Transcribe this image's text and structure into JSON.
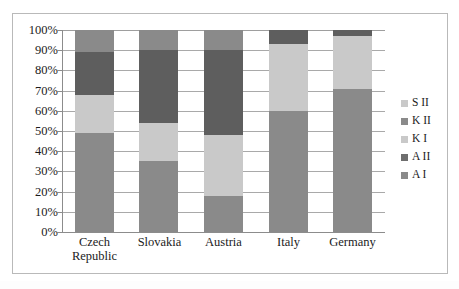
{
  "chart_data": {
    "type": "bar",
    "subtype": "stacked-100-percent",
    "title": "",
    "xlabel": "",
    "ylabel": "",
    "ylim": [
      0,
      100
    ],
    "y_unit": "%",
    "grid": true,
    "legend_position": "right",
    "categories": [
      "Czech Republic",
      "Slovakia",
      "Austria",
      "Italy",
      "Germany"
    ],
    "category_lines": [
      [
        "Czech",
        "Republic"
      ],
      [
        "Slovakia"
      ],
      [
        "Austria"
      ],
      [
        "Italy"
      ],
      [
        "Germany"
      ]
    ],
    "y_ticks": [
      "0%",
      "10%",
      "20%",
      "30%",
      "40%",
      "50%",
      "60%",
      "70%",
      "80%",
      "90%",
      "100%"
    ],
    "y_tick_values": [
      0,
      10,
      20,
      30,
      40,
      50,
      60,
      70,
      80,
      90,
      100
    ],
    "series": [
      {
        "name": "A I",
        "color": "#8a8a8a",
        "values": [
          49,
          35,
          18,
          60,
          71
        ]
      },
      {
        "name": "A II",
        "color": "#c9c9c9",
        "values": [
          19,
          19,
          30,
          33,
          26
        ]
      },
      {
        "name": "K I",
        "color": "#5e5e5e",
        "values": [
          21,
          36,
          42,
          7,
          3
        ]
      },
      {
        "name": "K II",
        "color": "#8a8a8a",
        "values": [
          11,
          10,
          10,
          0,
          0
        ]
      },
      {
        "name": "S II",
        "color": "#c9c9c9",
        "values": [
          0,
          0,
          0,
          0,
          0
        ]
      }
    ],
    "legend_entries": [
      {
        "label": "S II",
        "color": "#c9c9c9"
      },
      {
        "label": "K II",
        "color": "#8a8a8a"
      },
      {
        "label": "K I",
        "color": "#c9c9c9"
      },
      {
        "label": "A II",
        "color": "#6e6e6e"
      },
      {
        "label": "A I",
        "color": "#8a8a8a"
      }
    ]
  },
  "colors": {
    "frame": "#b9b9b9",
    "gridline": "#a9a9a9",
    "axis": "#8c8c8c",
    "text": "#1b1b1b",
    "background": "#ffffff"
  }
}
